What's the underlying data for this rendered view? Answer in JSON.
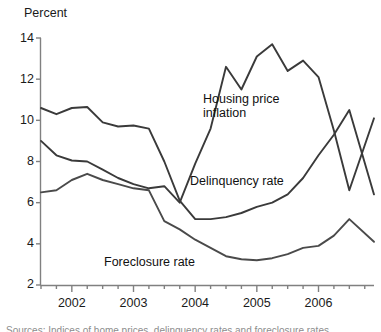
{
  "chart_data": {
    "type": "line",
    "title": "",
    "ylabel": "Percent",
    "xlabel": "",
    "ylim": [
      2,
      14
    ],
    "xlim": [
      2001.5,
      2006.9
    ],
    "grid": false,
    "legend_position": "inline-annotations",
    "ytick_labels": [
      "14",
      "12",
      "10",
      "8",
      "6",
      "4",
      "2"
    ],
    "ytick_values": [
      14,
      12,
      10,
      8,
      6,
      4,
      2
    ],
    "xtick_labels": [
      "2002",
      "2003",
      "2004",
      "2005",
      "2006"
    ],
    "xtick_values": [
      2002,
      2003,
      2004,
      2005,
      2006
    ],
    "minor_xticks_per_year": 4,
    "series": [
      {
        "name": "Housing price inflation",
        "color": "#3a3a3a",
        "x": [
          2001.5,
          2001.75,
          2002.0,
          2002.25,
          2002.5,
          2002.75,
          2003.0,
          2003.25,
          2003.5,
          2003.75,
          2004.0,
          2004.25,
          2004.5,
          2004.75,
          2005.0,
          2005.25,
          2005.5,
          2005.75,
          2006.0,
          2006.25,
          2006.5,
          2006.9
        ],
        "values": [
          10.6,
          10.3,
          10.6,
          10.65,
          9.9,
          9.7,
          9.75,
          9.6,
          8.0,
          6.1,
          5.2,
          5.2,
          5.3,
          5.5,
          5.8,
          6.0,
          6.4,
          7.2,
          8.3,
          9.3,
          10.5,
          6.4
        ]
      },
      {
        "name": "Delinquency rate",
        "color": "#3a3a3a",
        "x": [
          2001.5,
          2001.75,
          2002.0,
          2002.25,
          2002.5,
          2002.75,
          2003.0,
          2003.25,
          2003.5,
          2003.75,
          2004.0,
          2004.25,
          2004.5,
          2004.75,
          2005.0,
          2005.25,
          2005.5,
          2005.75,
          2006.0,
          2006.25,
          2006.5,
          2006.9
        ],
        "values": [
          9.0,
          8.3,
          8.05,
          8.0,
          7.6,
          7.2,
          6.9,
          6.7,
          6.8,
          6.0,
          7.9,
          9.6,
          12.6,
          11.5,
          13.1,
          13.7,
          12.4,
          12.9,
          12.1,
          9.5,
          6.6,
          10.1
        ]
      },
      {
        "name": "Foreclosure rate",
        "color": "#4a4a4a",
        "x": [
          2001.5,
          2001.75,
          2002.0,
          2002.25,
          2002.5,
          2002.75,
          2003.0,
          2003.25,
          2003.5,
          2003.75,
          2004.0,
          2004.25,
          2004.5,
          2004.75,
          2005.0,
          2005.25,
          2005.5,
          2005.75,
          2006.0,
          2006.25,
          2006.5,
          2006.9
        ],
        "values": [
          6.5,
          6.6,
          7.1,
          7.4,
          7.1,
          6.9,
          6.7,
          6.6,
          5.1,
          4.7,
          4.2,
          3.8,
          3.4,
          3.25,
          3.2,
          3.3,
          3.5,
          3.8,
          3.9,
          4.4,
          5.2,
          4.1
        ]
      }
    ],
    "annotations": [
      {
        "text": "Housing price\ninflation",
        "x_px": 203,
        "y_px": 92
      },
      {
        "text": "Delinquency rate",
        "x_px": 190,
        "y_px": 174
      },
      {
        "text": "Foreclosure rate",
        "x_px": 104,
        "y_px": 255
      }
    ],
    "clipped_caption": "Sources: Indices of home prices, delinquency rates and foreclosure rates"
  }
}
